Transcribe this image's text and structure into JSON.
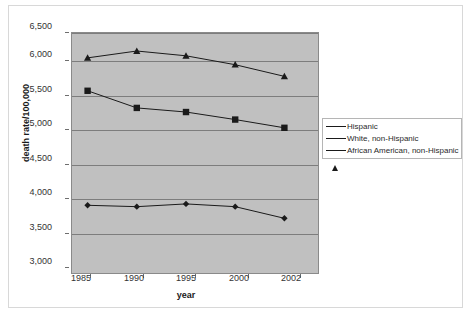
{
  "chart_data": {
    "type": "line",
    "title": "",
    "xlabel": "year",
    "ylabel": "death  rate/100,000",
    "categories": [
      "1985",
      "1990",
      "1995",
      "2000",
      "2002"
    ],
    "x_tick_labels": [
      "1985",
      "1990",
      "1995",
      "2000",
      "2002"
    ],
    "y_tick_labels": [
      "3,000",
      "3,500",
      "4,000",
      "4,500",
      "5,000",
      "5,500",
      "6,000",
      "6,500"
    ],
    "y_tick_values": [
      3000,
      3500,
      4000,
      4500,
      5000,
      5500,
      6000,
      6500
    ],
    "ylim": [
      3000,
      6500
    ],
    "grid": true,
    "legend_position": "right",
    "plot_background": "#c0c0c0",
    "series": [
      {
        "name": "Hispanic",
        "marker": "diamond",
        "color": "#1a1a1a",
        "values": [
          3900,
          3880,
          3920,
          3880,
          3710
        ]
      },
      {
        "name": "White, non-Hispanic",
        "marker": "square",
        "color": "#1a1a1a",
        "values": [
          5570,
          5320,
          5260,
          5150,
          5030
        ]
      },
      {
        "name": "African American, non-Hispanic",
        "marker": "triangle",
        "color": "#1a1a1a",
        "values": [
          6050,
          6150,
          6080,
          5950,
          5780
        ]
      }
    ]
  },
  "legend": {
    "items": [
      {
        "label": "Hispanic",
        "marker": "diamond"
      },
      {
        "label": "White, non-Hispanic",
        "marker": "square"
      },
      {
        "label": "African American, non-Hispanic",
        "marker": "triangle"
      }
    ]
  },
  "axes": {
    "y_title": "death  rate/100,000",
    "x_title": "year"
  }
}
